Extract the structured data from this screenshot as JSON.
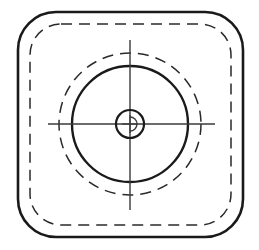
{
  "canvas": {
    "width": 259,
    "height": 250,
    "background_color": "#ffffff",
    "title": "Rounded square outline with concentric circles and centre cross"
  },
  "colors": {
    "outline_stroke": "#1a1a1a",
    "dashed_stroke": "#2a2a2a",
    "thin_stroke": "#3a3a3a",
    "background": "#ffffff"
  },
  "geometry": {
    "center": {
      "x": 130,
      "y": 124
    },
    "outer_rounded_square": {
      "name": "outer-body-outline",
      "x": 18,
      "y": 12,
      "width": 225,
      "height": 225,
      "corner_radius": 38,
      "stroke_width": 2.6,
      "style": "solid"
    },
    "inner_dashed_square": {
      "name": "inner-hidden-outline",
      "x": 30,
      "y": 24,
      "width": 201,
      "height": 201,
      "corner_radius": 31,
      "stroke_width": 1.5,
      "style": "dashed",
      "dash_pattern": "11 7"
    },
    "outer_dashed_circle": {
      "name": "hidden-bore-circle",
      "cx": 130,
      "cy": 124,
      "radius": 71,
      "stroke_width": 1.5,
      "style": "dashed",
      "dash_pattern": "11 7"
    },
    "solid_circle": {
      "name": "main-boss-circle",
      "cx": 130,
      "cy": 124,
      "radius": 58,
      "stroke_width": 2.4,
      "style": "solid"
    },
    "center_circle": {
      "name": "centre-hole-circle",
      "cx": 130,
      "cy": 124,
      "radius": 14,
      "stroke_width": 2.2,
      "style": "solid"
    },
    "crosshair_horizontal": {
      "name": "horizontal-centreline",
      "x1": 48,
      "y1": 124,
      "x2": 215,
      "y2": 124,
      "stroke_width": 1.4,
      "style": "solid"
    },
    "crosshair_vertical": {
      "name": "vertical-centreline",
      "x1": 130,
      "y1": 40,
      "x2": 130,
      "y2": 210,
      "stroke_width": 1.4,
      "style": "solid"
    },
    "centre_symbol": {
      "name": "centre-datum-symbol",
      "description": "small arc and vertical tick inside centre hole",
      "arc_radius": 7,
      "stroke_width": 1.2
    }
  },
  "labels": {
    "drawing_type": "Technical line drawing",
    "has_text": false,
    "note": ""
  }
}
